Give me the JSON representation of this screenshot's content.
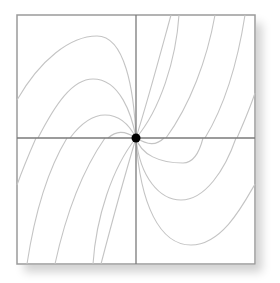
{
  "diagram": {
    "type": "phase-portrait",
    "frame": {
      "x": 17,
      "y": 15,
      "width": 238,
      "height": 249,
      "stroke": "#9a9a9a"
    },
    "axes": {
      "color": "#7a7a7a",
      "vertical_x": 136,
      "horizontal_y": 138
    },
    "equilibrium": {
      "cx": 136,
      "cy": 138,
      "r": 4.5,
      "color": "#000000",
      "label": "equilibrium-point"
    },
    "trajectory_color": "#c4c4c4",
    "trajectories": [
      {
        "quadrant": "top-left",
        "d": "M17,100 C40,60 70,36 97,36 C125,36 134,90 136,138"
      },
      {
        "quadrant": "top-left",
        "d": "M38,138 C55,105 72,79 93,79 C120,79 132,115 136,138"
      },
      {
        "quadrant": "top-left",
        "d": "M70,138 C82,122 93,115 105,115 C122,115 131,128 136,138"
      },
      {
        "quadrant": "top-left",
        "d": "M108,138 C116,131 124,130 136,138"
      },
      {
        "quadrant": "top-right",
        "d": "M136,138 C148,100 160,55 171,15"
      },
      {
        "quadrant": "top-right",
        "d": "M136,138 C160,110 176,60 179,15"
      },
      {
        "quadrant": "top-right",
        "d": "M166,138 C190,105 207,60 215,15"
      },
      {
        "quadrant": "top-right",
        "d": "M205,138 C225,105 238,60 245,15"
      },
      {
        "quadrant": "top-right",
        "d": "M237,138 C244,122 250,108 255,93"
      },
      {
        "quadrant": "bottom-left",
        "d": "M36,138 C29,154 23,168 17,185"
      },
      {
        "quadrant": "bottom-left",
        "d": "M67,138 C47,171 34,218 27,264"
      },
      {
        "quadrant": "bottom-left",
        "d": "M105,138 C82,171 65,218 55,264"
      },
      {
        "quadrant": "bottom-left",
        "d": "M136,138 C112,168 96,218 93,264"
      },
      {
        "quadrant": "bottom-left",
        "d": "M136,138 C124,178 112,222 101,264"
      },
      {
        "quadrant": "bottom-right",
        "d": "M136,138 C148,145 156,146 164,138"
      },
      {
        "quadrant": "bottom-right",
        "d": "M136,138 C141,155 160,163 183,163 C195,163 200,150 203,138"
      },
      {
        "quadrant": "bottom-right",
        "d": "M136,138 C140,178 160,200 181,200 C205,200 225,170 236,138"
      },
      {
        "quadrant": "bottom-right",
        "d": "M136,138 C140,205 160,245 191,245 C222,245 243,205 255,184"
      }
    ]
  }
}
